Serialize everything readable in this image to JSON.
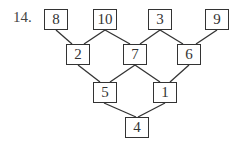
{
  "problem": {
    "number": "14."
  },
  "pyramid": {
    "rows": [
      [
        "8",
        "10",
        "3",
        "9"
      ],
      [
        "2",
        "7",
        "6"
      ],
      [
        "5",
        "1"
      ],
      [
        "4"
      ]
    ]
  }
}
